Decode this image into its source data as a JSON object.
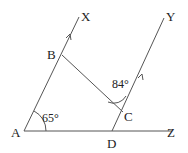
{
  "diagram": {
    "points": {
      "A": {
        "label": "A",
        "x": 24,
        "y": 131
      },
      "B": {
        "label": "B",
        "x": 62,
        "y": 53
      },
      "C": {
        "label": "C",
        "x": 118,
        "y": 113
      },
      "D": {
        "label": "D",
        "x": 112,
        "y": 131
      },
      "X": {
        "label": "X",
        "x": 79,
        "y": 14
      },
      "Y": {
        "label": "Y",
        "x": 167,
        "y": 13
      },
      "Z": {
        "label": "Z",
        "x": 176,
        "y": 131
      }
    },
    "angles": {
      "A": {
        "label": "65°"
      },
      "C": {
        "label": "84°"
      }
    },
    "segments": [
      "AX",
      "AZ",
      "BC",
      "DY"
    ],
    "parallel_marks": [
      "AX",
      "DY"
    ]
  }
}
